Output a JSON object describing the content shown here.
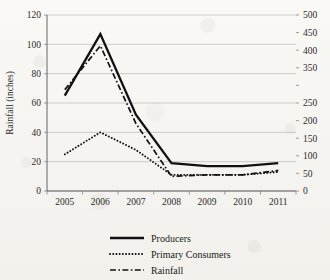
{
  "chart_data": {
    "type": "line",
    "title": "",
    "xlabel": "",
    "ylabel": "Rainfall (inches)",
    "categories": [
      "2005",
      "2006",
      "2007",
      "2008",
      "2009",
      "2010",
      "2011"
    ],
    "x": [
      2005,
      2006,
      2007,
      2008,
      2009,
      2010,
      2011
    ],
    "ylim": [
      0,
      120
    ],
    "yticks": [
      "0",
      "20",
      "40",
      "60",
      "80",
      "100",
      "120"
    ],
    "y2lim": [
      0,
      500
    ],
    "y2ticks": [
      "0",
      "50",
      "100",
      "150",
      "200",
      "250",
      "350",
      "400",
      "450",
      "500"
    ],
    "y2ticks_note": "right-axis label for 300 is absent in the source image",
    "grid": true,
    "legend_position": "bottom",
    "series": [
      {
        "name": "Producers",
        "axis": "left",
        "style": "solid",
        "values": [
          65,
          107,
          52,
          19,
          17,
          17,
          19
        ]
      },
      {
        "name": "Primary Consumers",
        "axis": "left",
        "style": "dotted",
        "values": [
          25,
          40,
          28,
          11,
          11,
          11,
          13
        ]
      },
      {
        "name": "Rainfall",
        "axis": "left",
        "style": "dash-dot",
        "values": [
          69,
          99,
          46,
          10,
          11,
          11,
          14
        ]
      }
    ]
  },
  "legend": {
    "items": [
      {
        "label": "Producers",
        "style": "solid"
      },
      {
        "label": "Primary Consumers",
        "style": "dotted"
      },
      {
        "label": "Rainfall",
        "style": "dash-dot"
      }
    ]
  },
  "colors": {
    "series": "#111111",
    "grid": "#b9b9b4",
    "axis": "#555555",
    "text": "#1a1a1a",
    "background": "#f7f6f3"
  }
}
